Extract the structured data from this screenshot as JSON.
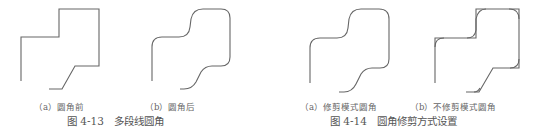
{
  "figure_4_13": {
    "caption": "图 4-13　多段线圆角",
    "sub_a": "（a）圆角前",
    "sub_b": "（b）圆角后"
  },
  "figure_4_14": {
    "caption": "图 4-14　圆角修剪方式设置",
    "sub_a": "（a）修剪模式圆角",
    "sub_b": "（b）不修剪模式圆角"
  }
}
